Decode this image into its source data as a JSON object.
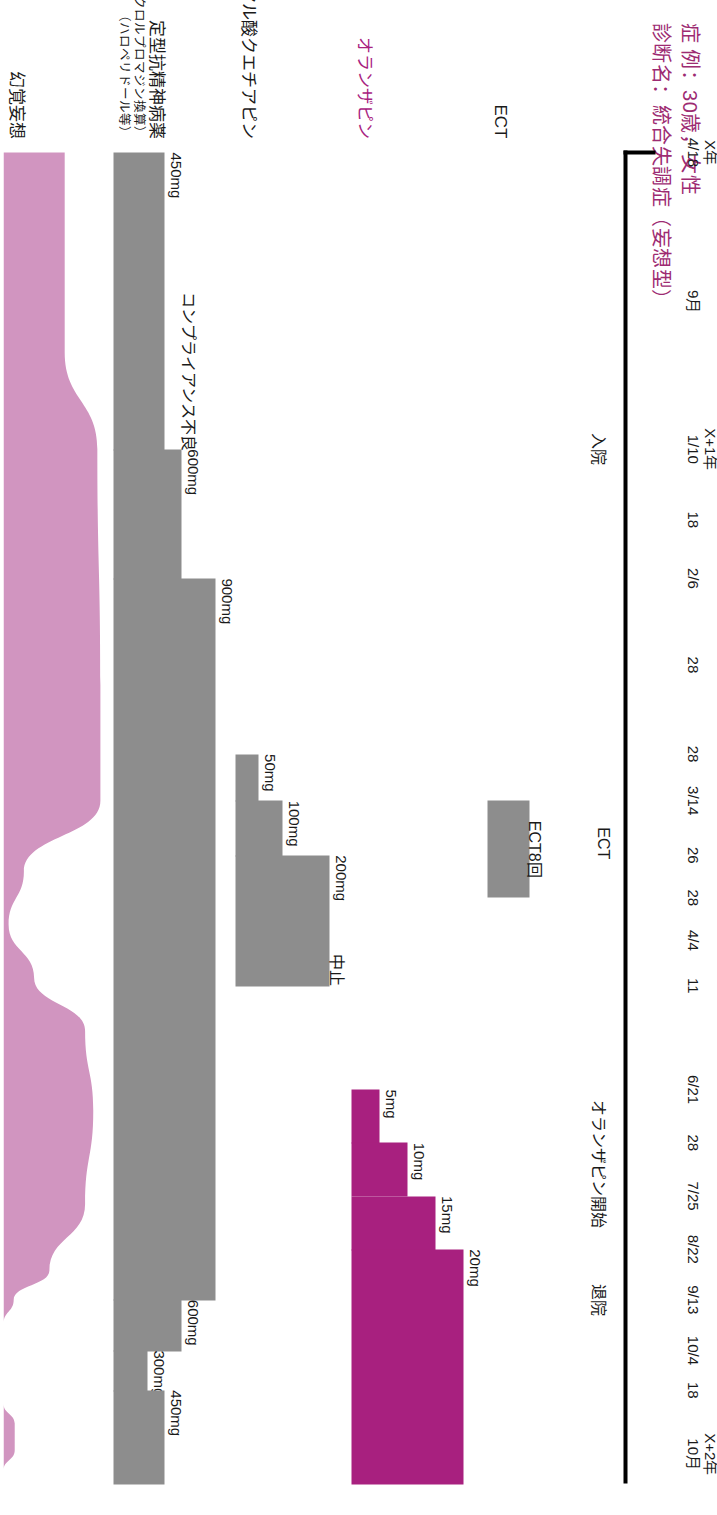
{
  "header": {
    "line1": "症 例：30歳，女性",
    "line2": "診断名：統合失調症（妄想型）",
    "color": "#9d2b72"
  },
  "colors": {
    "magenta": "#a8207f",
    "pink": "#d195c0",
    "grey": "#8d8d8d",
    "header_pink": "#9d2b72",
    "axis": "#000000"
  },
  "axis": {
    "ticks": [
      {
        "l1": "X年",
        "l2": "4/18",
        "pos": 0.0
      },
      {
        "l1": "",
        "l2": "9月",
        "pos": 0.112
      },
      {
        "l1": "X+1年",
        "l2": "1/10",
        "pos": 0.223
      },
      {
        "l1": "",
        "l2": "18",
        "pos": 0.276
      },
      {
        "l1": "",
        "l2": "2/6",
        "pos": 0.32
      },
      {
        "l1": "",
        "l2": "28",
        "pos": 0.385
      },
      {
        "l1": "",
        "l2": "28",
        "pos": 0.452
      },
      {
        "l1": "",
        "l2": "3/14",
        "pos": 0.487
      },
      {
        "l1": "",
        "l2": "26",
        "pos": 0.528
      },
      {
        "l1": "",
        "l2": "28",
        "pos": 0.56
      },
      {
        "l1": "",
        "l2": "4/4",
        "pos": 0.592
      },
      {
        "l1": "",
        "l2": "11",
        "pos": 0.626
      },
      {
        "l1": "",
        "l2": "6/21",
        "pos": 0.704
      },
      {
        "l1": "",
        "l2": "28",
        "pos": 0.744
      },
      {
        "l1": "",
        "l2": "7/25",
        "pos": 0.784
      },
      {
        "l1": "",
        "l2": "8/22",
        "pos": 0.824
      },
      {
        "l1": "",
        "l2": "9/13",
        "pos": 0.862
      },
      {
        "l1": "",
        "l2": "10/4",
        "pos": 0.9
      },
      {
        "l1": "",
        "l2": "18",
        "pos": 0.93
      },
      {
        "l1": "X+2年",
        "l2": "10月",
        "pos": 0.978
      }
    ],
    "events": [
      {
        "label": "入院",
        "pos": 0.223
      },
      {
        "label": "ECT",
        "pos": 0.519
      },
      {
        "label": "オランザピン開始",
        "pos": 0.76
      },
      {
        "label": "退院",
        "pos": 0.862
      }
    ]
  },
  "rows": [
    {
      "name": "ect",
      "label": "ECT",
      "sub": "",
      "sub2": "",
      "pink": false
    },
    {
      "name": "olanzapine",
      "label": "オランザピン",
      "sub": "",
      "sub2": "",
      "pink": true
    },
    {
      "name": "quetiapine",
      "label": "フマル酸クエチアピン",
      "sub": "",
      "sub2": "",
      "pink": false
    },
    {
      "name": "typical",
      "label": "定型抗精神病薬",
      "sub": "（塩酸クロルプロマジン換算）",
      "sub2": "（ハロペリドール等）",
      "pink": false
    },
    {
      "name": "symptoms",
      "label": "幻覚妄想",
      "sub": "",
      "sub2": "",
      "pink": false
    }
  ],
  "chart_data": {
    "type": "area",
    "xlabel": "",
    "ylabel": "",
    "x_axis_ticks": [
      "X年 4/18",
      "9月",
      "X+1年 1/10",
      "18",
      "2/6",
      "28",
      "28",
      "3/14",
      "26",
      "28",
      "4/4",
      "11",
      "6/21",
      "28",
      "7/25",
      "8/22",
      "9/13",
      "10/4",
      "18",
      "X+2年 10月"
    ],
    "events": [
      "入院",
      "ECT",
      "オランザピン開始",
      "退院"
    ],
    "series": [
      {
        "name": "ECT",
        "type": "bar",
        "color": "#8d8d8d",
        "annotation": "ECT8回",
        "segments": [
          {
            "start": 0.487,
            "end": 0.56,
            "height": 0.38,
            "label": ""
          }
        ]
      },
      {
        "name": "オランザピン",
        "type": "step",
        "unit": "mg",
        "color": "#a8207f",
        "segments": [
          {
            "start": 0.704,
            "end": 0.744,
            "value": 5,
            "label": "5mg"
          },
          {
            "start": 0.744,
            "end": 0.784,
            "value": 10,
            "label": "10mg"
          },
          {
            "start": 0.784,
            "end": 0.824,
            "value": 15,
            "label": "15mg"
          },
          {
            "start": 0.824,
            "end": 1.0,
            "value": 20,
            "label": "20mg"
          }
        ]
      },
      {
        "name": "フマル酸クエチアピン",
        "type": "step",
        "unit": "mg",
        "color": "#8d8d8d",
        "annotation": "中止",
        "segments": [
          {
            "start": 0.452,
            "end": 0.487,
            "value": 50,
            "label": "50mg"
          },
          {
            "start": 0.487,
            "end": 0.528,
            "value": 100,
            "label": "100mg"
          },
          {
            "start": 0.528,
            "end": 0.626,
            "value": 200,
            "label": "200mg"
          }
        ]
      },
      {
        "name": "定型抗精神病薬",
        "type": "step",
        "unit": "mg",
        "color": "#8d8d8d",
        "annotation": "コンプライアンス不良",
        "segments": [
          {
            "start": 0.0,
            "end": 0.223,
            "value": 450,
            "label": "450mg"
          },
          {
            "start": 0.223,
            "end": 0.32,
            "value": 600,
            "label": "600mg"
          },
          {
            "start": 0.32,
            "end": 0.862,
            "value": 900,
            "label": "900mg"
          },
          {
            "start": 0.862,
            "end": 0.9,
            "value": 600,
            "label": "600mg"
          },
          {
            "start": 0.9,
            "end": 0.93,
            "value": 300,
            "label": "300mg"
          },
          {
            "start": 0.93,
            "end": 1.0,
            "value": 450,
            "label": "450mg"
          }
        ]
      },
      {
        "name": "幻覚妄想",
        "type": "area",
        "color": "#d195c0",
        "description": "症状の重症度推移：入院時高値、ECT後一時寛解、再燃後オランザピンで改善",
        "points": [
          {
            "x": 0.0,
            "y": 0.6
          },
          {
            "x": 0.15,
            "y": 0.6
          },
          {
            "x": 0.223,
            "y": 0.92
          },
          {
            "x": 0.4,
            "y": 0.95
          },
          {
            "x": 0.487,
            "y": 0.95
          },
          {
            "x": 0.54,
            "y": 0.2
          },
          {
            "x": 0.58,
            "y": 0.05
          },
          {
            "x": 0.62,
            "y": 0.3
          },
          {
            "x": 0.66,
            "y": 0.8
          },
          {
            "x": 0.72,
            "y": 0.88
          },
          {
            "x": 0.79,
            "y": 0.8
          },
          {
            "x": 0.84,
            "y": 0.45
          },
          {
            "x": 0.862,
            "y": 0.1
          },
          {
            "x": 0.88,
            "y": 0.0
          },
          {
            "x": 0.94,
            "y": 0.0
          },
          {
            "x": 0.955,
            "y": 0.11
          },
          {
            "x": 0.975,
            "y": 0.11
          },
          {
            "x": 0.99,
            "y": 0.0
          }
        ]
      }
    ]
  }
}
